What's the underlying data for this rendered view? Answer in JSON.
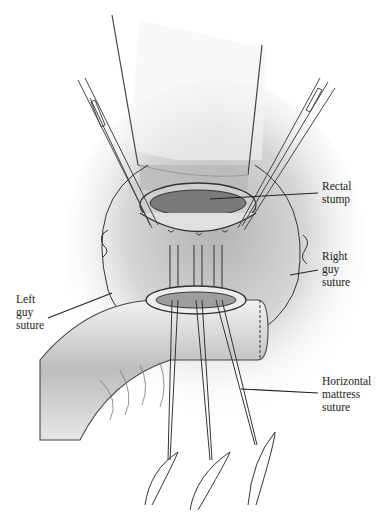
{
  "figure": {
    "labels": {
      "rectal_stump": "Rectal\nstump",
      "right_guy_suture": "Right\nguy\nsuture",
      "left_guy_suture": "Left\nguy\nsuture",
      "horizontal_mattress_suture": "Horizontal\nmattress\nsuture"
    },
    "colors": {
      "ink": "#2a2a2a",
      "shade": "#8a8a8a",
      "tissue": "#d9d9d9",
      "background": "#ffffff"
    }
  }
}
